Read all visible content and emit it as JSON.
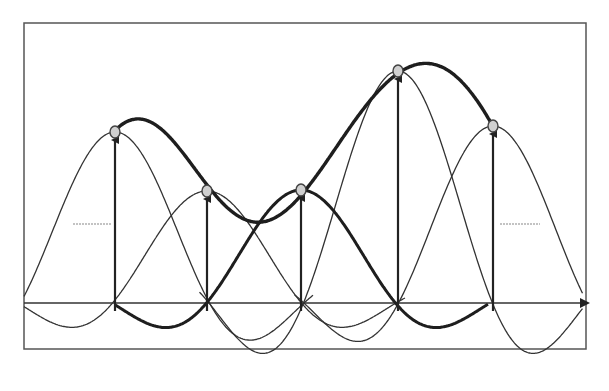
{
  "diagram": {
    "type": "sinc-interpolation",
    "colors": {
      "background": "#ffffff",
      "frame": "#555555",
      "axis": "#333333",
      "thick_curve": "#1e1e1e",
      "thin_curve": "#333333",
      "sample_marker_fill": "#d0d0d0",
      "sample_marker_stroke": "#444444",
      "dashed_level": "#888888"
    },
    "frame": {
      "x": 24,
      "y": 23,
      "width": 262,
      "height": 149,
      "x2": 286,
      "y2": 172
    },
    "axis": {
      "baseline_y": 303,
      "x_start": 24,
      "x_end": 588
    },
    "sample_spacing": 94.5,
    "samples": [
      {
        "x": 115,
        "y": 132
      },
      {
        "x": 207,
        "y": 191
      },
      {
        "x": 301,
        "y": 190
      },
      {
        "x": 398,
        "y": 71
      },
      {
        "x": 493,
        "y": 126
      }
    ],
    "thin_kernel_range": {
      "x_start": 24,
      "x_end": 583
    },
    "thick_curve_range": {
      "x_start": 115,
      "x_end": 493
    },
    "bold_kernel_index": 2,
    "bold_kernel_range": {
      "x_start": 115,
      "x_end": 488
    },
    "dashed_levels": [
      {
        "x1": 73,
        "x2": 112,
        "y": 224
      },
      {
        "x1": 500,
        "x2": 540,
        "y": 224
      }
    ]
  }
}
